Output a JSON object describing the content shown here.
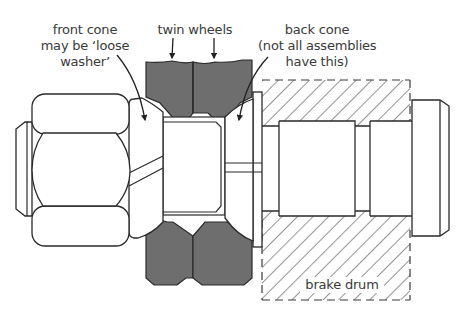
{
  "diagram": {
    "labels": {
      "front_cone": [
        "front cone",
        "may be ‘loose",
        "washer’"
      ],
      "twin_wheels": "twin wheels",
      "back_cone": [
        "back cone",
        "(not all assemblies",
        "have this)"
      ],
      "brake_drum": "brake drum"
    },
    "colors": {
      "wheel_fill": "#6e6e6e",
      "stroke": "#2a2a2a",
      "hatch": "#3a3a3a",
      "background": "#ffffff"
    }
  }
}
